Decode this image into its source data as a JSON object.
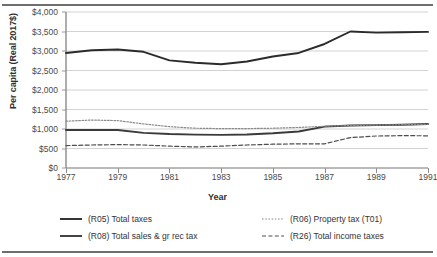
{
  "chart_data": {
    "type": "line",
    "title": "",
    "xlabel": "Year",
    "ylabel": "Per capita (Real 2017$)",
    "xlim": [
      1977,
      1991
    ],
    "ylim": [
      0,
      4000
    ],
    "grid": true,
    "legend_position": "bottom",
    "x": [
      1977,
      1978,
      1979,
      1980,
      1981,
      1982,
      1983,
      1984,
      1985,
      1986,
      1987,
      1988,
      1989,
      1990,
      1991
    ],
    "xticks": [
      "1977",
      "1979",
      "1981",
      "1983",
      "1985",
      "1987",
      "1989",
      "1991"
    ],
    "yticks": [
      "$0",
      "$500",
      "$1,000",
      "$1,500",
      "$2,000",
      "$2,500",
      "$3,000",
      "$3,500",
      "$4,000"
    ],
    "series": [
      {
        "name": "(R05) Total taxes",
        "style": "solid",
        "color": "#2b2b2b",
        "values": [
          2950,
          3020,
          3040,
          2980,
          2760,
          2700,
          2660,
          2730,
          2860,
          2950,
          3180,
          3500,
          3470,
          3480,
          3490
        ]
      },
      {
        "name": "(R08) Total sales & gr rec tax",
        "style": "solid",
        "color": "#3a3a3a",
        "values": [
          975,
          975,
          975,
          900,
          870,
          855,
          850,
          860,
          890,
          935,
          1060,
          1090,
          1100,
          1110,
          1130
        ]
      },
      {
        "name": "(R06) Property tax (T01)",
        "style": "dotted",
        "color": "#8a8a8a",
        "values": [
          1200,
          1230,
          1215,
          1130,
          1060,
          1020,
          1010,
          1010,
          1020,
          1040,
          1070,
          1090,
          1100,
          1110,
          1120
        ]
      },
      {
        "name": "(R26) Total income taxes",
        "style": "dashed",
        "color": "#4d4d4d",
        "values": [
          575,
          590,
          600,
          590,
          560,
          540,
          560,
          590,
          610,
          620,
          620,
          780,
          820,
          830,
          825
        ]
      }
    ]
  }
}
